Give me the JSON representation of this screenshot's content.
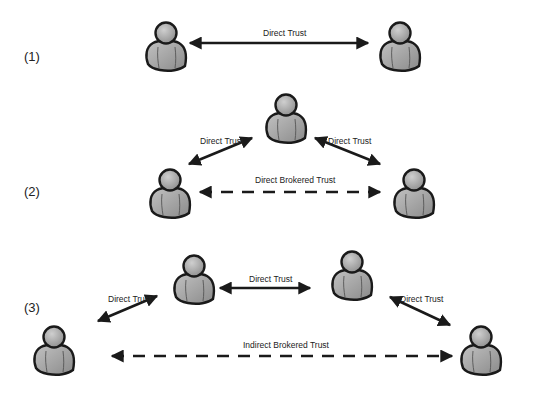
{
  "diagram": {
    "scenarios": [
      {
        "id": "1",
        "label": "(1)",
        "label_pos": [
          24,
          49
        ],
        "persons": [
          {
            "name": "person-a",
            "x": 142,
            "y": 20
          },
          {
            "name": "person-b",
            "x": 376,
            "y": 20
          }
        ],
        "edges": [
          {
            "name": "direct-trust",
            "label": "Direct Trust",
            "style": "solid",
            "x1": 190,
            "y1": 43,
            "x2": 368,
            "y2": 43,
            "label_x": 263,
            "label_y": 28
          }
        ]
      },
      {
        "id": "2",
        "label": "(2)",
        "label_pos": [
          24,
          184
        ],
        "persons": [
          {
            "name": "person-broker",
            "x": 262,
            "y": 92
          },
          {
            "name": "person-a",
            "x": 146,
            "y": 167
          },
          {
            "name": "person-b",
            "x": 390,
            "y": 167
          }
        ],
        "edges": [
          {
            "name": "direct-trust-left",
            "label": "Direct Trust",
            "style": "solid",
            "x1": 189,
            "y1": 164,
            "x2": 252,
            "y2": 138,
            "label_x": 200,
            "label_y": 136
          },
          {
            "name": "direct-trust-right",
            "label": "Direct Trust",
            "style": "solid",
            "x1": 315,
            "y1": 138,
            "x2": 380,
            "y2": 164,
            "label_x": 328,
            "label_y": 136
          },
          {
            "name": "direct-brokered-trust",
            "label": "Direct Brokered Trust",
            "style": "dashed",
            "x1": 200,
            "y1": 192,
            "x2": 380,
            "y2": 192,
            "label_x": 255,
            "label_y": 175
          }
        ]
      },
      {
        "id": "3",
        "label": "(3)",
        "label_pos": [
          24,
          300
        ],
        "persons": [
          {
            "name": "person-broker-1",
            "x": 170,
            "y": 253
          },
          {
            "name": "person-broker-2",
            "x": 328,
            "y": 249
          },
          {
            "name": "person-a",
            "x": 30,
            "y": 324
          },
          {
            "name": "person-b",
            "x": 457,
            "y": 324
          }
        ],
        "edges": [
          {
            "name": "direct-trust-left",
            "label": "Direct Trust",
            "style": "solid",
            "x1": 98,
            "y1": 321,
            "x2": 157,
            "y2": 296,
            "label_x": 108,
            "label_y": 294
          },
          {
            "name": "direct-trust-middle",
            "label": "Direct Trust",
            "style": "solid",
            "x1": 220,
            "y1": 288,
            "x2": 310,
            "y2": 288,
            "label_x": 249,
            "label_y": 274
          },
          {
            "name": "direct-trust-right",
            "label": "Direct Trust",
            "style": "solid",
            "x1": 390,
            "y1": 297,
            "x2": 450,
            "y2": 325,
            "label_x": 400,
            "label_y": 294
          },
          {
            "name": "indirect-brokered-trust",
            "label": "Indirect Brokered Trust",
            "style": "dashed",
            "x1": 112,
            "y1": 356,
            "x2": 452,
            "y2": 356,
            "label_x": 243,
            "label_y": 340
          }
        ]
      }
    ],
    "colors": {
      "background": "#ffffff",
      "person_fill": "#a8a8a8",
      "person_head": "#b4b4b4",
      "person_outline": "#1a1a1a",
      "arrow": "#1a1a1a",
      "text": "#222222"
    }
  }
}
